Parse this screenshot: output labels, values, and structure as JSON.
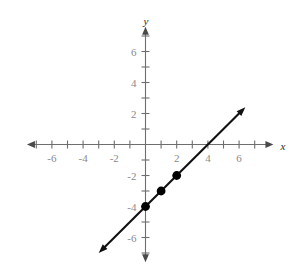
{
  "chart_data": {
    "type": "line",
    "title": "",
    "xlabel": "x",
    "ylabel": "y",
    "xlim": [
      -7.6,
      8.2
    ],
    "ylim": [
      -7.6,
      7.6
    ],
    "grid": false,
    "legend": null,
    "x_tick_labels": [
      "-6",
      "-4",
      "-2",
      "2",
      "4",
      "6"
    ],
    "x_tick_label_values": [
      -6,
      -4,
      -2,
      2,
      4,
      6
    ],
    "x_tick_values": [
      -7,
      -6,
      -5,
      -4,
      -3,
      -2,
      -1,
      1,
      2,
      3,
      4,
      5,
      6,
      7
    ],
    "y_tick_labels": [
      "6",
      "4",
      "2",
      "-2",
      "-4",
      "-6"
    ],
    "y_tick_label_values": [
      6,
      4,
      2,
      -2,
      -4,
      -6
    ],
    "y_tick_values": [
      -7,
      -6,
      -5,
      -4,
      -3,
      -2,
      -1,
      1,
      2,
      3,
      4,
      5,
      6,
      7
    ],
    "series": [
      {
        "name": "y = x - 4",
        "slope": 1,
        "intercept": -4,
        "x_start": -3.0,
        "x_end": 6.4,
        "arrows": "both",
        "color": "#111111"
      }
    ],
    "points": [
      {
        "label": "(0, -4)",
        "x": 0,
        "y": -4
      },
      {
        "label": "(1, -3)",
        "x": 1,
        "y": -3
      },
      {
        "label": "(2, -2)",
        "x": 2,
        "y": -2
      }
    ],
    "x_intercept": 4,
    "y_intercept": -4
  },
  "axis_labels": {
    "x": "x",
    "y": "y"
  },
  "colors": {
    "axis": "#6e6e6e",
    "tick_text": "#8a8a8a",
    "line": "#111111",
    "point": "#000000",
    "background": "#ffffff"
  },
  "x_ticks": [
    {
      "label": "-6",
      "value": -6
    },
    {
      "label": "-4",
      "value": -4
    },
    {
      "label": "-2",
      "value": -2
    },
    {
      "label": "2",
      "value": 2
    },
    {
      "label": "4",
      "value": 4
    },
    {
      "label": "6",
      "value": 6
    }
  ],
  "y_ticks": [
    {
      "label": "6",
      "value": 6
    },
    {
      "label": "4",
      "value": 4
    },
    {
      "label": "2",
      "value": 2
    },
    {
      "label": "-2",
      "value": -2
    },
    {
      "label": "-4",
      "value": -4
    },
    {
      "label": "-6",
      "value": -6
    }
  ]
}
